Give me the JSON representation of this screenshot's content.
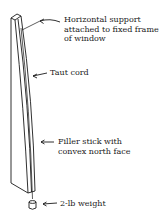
{
  "labels": {
    "support": "Horizontal support\nattached to fixed frame\nof window",
    "cord": "Taut cord",
    "filler": "Filler stick with\nconvex north face",
    "weight": "2-lb weight"
  },
  "colors": {
    "line": "#1a1a1a",
    "background": "#ffffff"
  }
}
